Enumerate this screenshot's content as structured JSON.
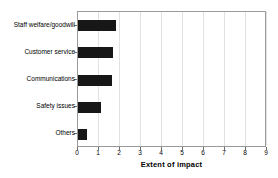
{
  "chart_data": {
    "type": "bar",
    "orientation": "horizontal",
    "title": "",
    "subtitle": "",
    "xlabel": "Extent of impact",
    "ylabel": "",
    "categories": [
      "Staff welfare/goodwill",
      "Customer service",
      "Communications",
      "Safety issues",
      "Others"
    ],
    "values": [
      1.8,
      1.65,
      1.62,
      1.1,
      0.42
    ],
    "xlim": [
      0,
      9
    ],
    "xticks": [
      0,
      1,
      2,
      3,
      4,
      5,
      6,
      7,
      8,
      9
    ],
    "xtick_labels": [
      "0",
      "1",
      "2",
      "3",
      "4",
      "5",
      "6",
      "7",
      "8",
      "9"
    ],
    "grid": "vertical",
    "legend": "none",
    "bar_color": "#171717",
    "grid_color": "#e2e2e2",
    "frame_color": "#9a9a9a",
    "background": "#ffffff"
  }
}
